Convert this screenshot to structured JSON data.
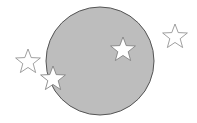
{
  "canvas": {
    "width": 197,
    "height": 123,
    "background": "#ffffff"
  },
  "circle": {
    "cx": 100,
    "cy": 61,
    "r": 54,
    "fill": "#bdbdbd",
    "stroke": "#555555"
  },
  "stars": [
    {
      "id": "star-left-outside",
      "cx": 28,
      "cy": 62,
      "r": 13,
      "fill": "#ffffff",
      "stroke": "#888888"
    },
    {
      "id": "star-left-edge",
      "cx": 53,
      "cy": 79,
      "r": 13,
      "fill": "#ffffff",
      "stroke": "#777777"
    },
    {
      "id": "star-inside",
      "cx": 123,
      "cy": 50,
      "r": 13,
      "fill": "#ffffff",
      "stroke": "#777777"
    },
    {
      "id": "star-right-outside",
      "cx": 175,
      "cy": 37,
      "r": 13,
      "fill": "#ffffff",
      "stroke": "#888888"
    }
  ]
}
